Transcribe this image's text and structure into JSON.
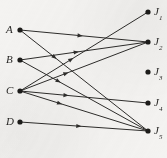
{
  "figure": {
    "type": "bipartite-assignment-diagram",
    "width": 167,
    "height": 158,
    "background_color": "#f4f3f1",
    "edge_color": "#2e2d2b",
    "node_color": "#1d1c1a",
    "label_color": "#2b2a28"
  },
  "left_nodes": [
    {
      "id": "A",
      "label": "A",
      "subscript": "",
      "x": 20,
      "y": 30,
      "label_x": 6,
      "label_y": 24
    },
    {
      "id": "B",
      "label": "B",
      "subscript": "",
      "x": 20,
      "y": 60,
      "label_x": 6,
      "label_y": 54
    },
    {
      "id": "C",
      "label": "C",
      "subscript": "",
      "x": 20,
      "y": 91,
      "label_x": 6,
      "label_y": 85
    },
    {
      "id": "D",
      "label": "D",
      "subscript": "",
      "x": 20,
      "y": 122,
      "label_x": 6,
      "label_y": 116
    }
  ],
  "right_nodes": [
    {
      "id": "J1",
      "label": "J",
      "subscript": "1",
      "x": 148,
      "y": 12,
      "label_x": 154,
      "label_y": 6
    },
    {
      "id": "J2",
      "label": "J",
      "subscript": "2",
      "x": 148,
      "y": 42,
      "label_x": 154,
      "label_y": 36
    },
    {
      "id": "J3",
      "label": "J",
      "subscript": "3",
      "x": 148,
      "y": 72,
      "label_x": 154,
      "label_y": 66
    },
    {
      "id": "J4",
      "label": "J",
      "subscript": "4",
      "x": 148,
      "y": 103,
      "label_x": 154,
      "label_y": 97
    },
    {
      "id": "J5",
      "label": "J",
      "subscript": "5",
      "x": 148,
      "y": 131,
      "label_x": 154,
      "label_y": 125
    }
  ],
  "edges": [
    {
      "from": "A",
      "to": "J2",
      "x1": 20,
      "y1": 30,
      "x2": 148,
      "y2": 42,
      "arrow_t": 0.47
    },
    {
      "from": "A",
      "to": "J5",
      "x1": 20,
      "y1": 30,
      "x2": 148,
      "y2": 131,
      "arrow_t": 0.27
    },
    {
      "from": "B",
      "to": "J2",
      "x1": 20,
      "y1": 60,
      "x2": 148,
      "y2": 42,
      "arrow_t": 0.44
    },
    {
      "from": "B",
      "to": "J5",
      "x1": 20,
      "y1": 60,
      "x2": 148,
      "y2": 131,
      "arrow_t": 0.3
    },
    {
      "from": "C",
      "to": "J1",
      "x1": 20,
      "y1": 91,
      "x2": 148,
      "y2": 12,
      "arrow_t": 0.4
    },
    {
      "from": "C",
      "to": "J2",
      "x1": 20,
      "y1": 91,
      "x2": 148,
      "y2": 42,
      "arrow_t": 0.36
    },
    {
      "from": "C",
      "to": "J4",
      "x1": 20,
      "y1": 91,
      "x2": 148,
      "y2": 103,
      "arrow_t": 0.36
    },
    {
      "from": "C",
      "to": "J5",
      "x1": 20,
      "y1": 91,
      "x2": 148,
      "y2": 131,
      "arrow_t": 0.31
    },
    {
      "from": "D",
      "to": "J5",
      "x1": 20,
      "y1": 122,
      "x2": 148,
      "y2": 131,
      "arrow_t": 0.46
    }
  ],
  "node_radius": 2.6,
  "edge_width": 1.0,
  "arrow_size": 5.2
}
